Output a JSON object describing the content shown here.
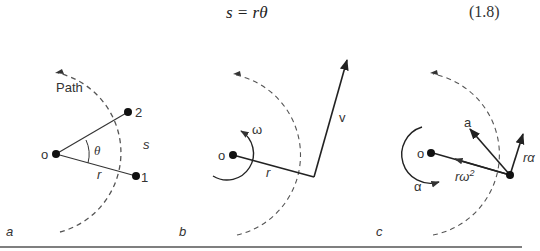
{
  "equation": {
    "text": "s = rθ",
    "number": "(1.8)"
  },
  "panels": [
    {
      "id": "a",
      "label": "a",
      "center": "o",
      "path_label": "Path",
      "points": [
        "1",
        "2"
      ],
      "angle": "θ",
      "arc": "s",
      "radius": "r"
    },
    {
      "id": "b",
      "label": "b",
      "center": "o",
      "angular_velocity": "ω",
      "velocity": "v",
      "radius": "r"
    },
    {
      "id": "c",
      "label": "c",
      "center": "o",
      "acceleration": "a",
      "tangential": "rα",
      "centripetal": "rω",
      "centripetal_exp": "2",
      "angular_acceleration": "α"
    }
  ],
  "colors": {
    "line": "#222222",
    "dashed": "#555555",
    "background": "#ffffff",
    "rule": "#555555"
  }
}
